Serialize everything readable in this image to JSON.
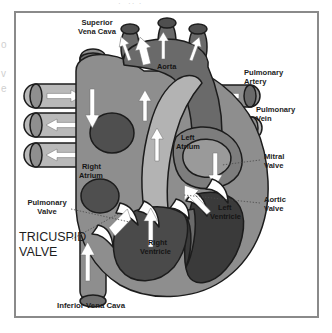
{
  "figure": {
    "type": "labeled-anatomical-illustration",
    "style": "grayscale line-and-tone scan"
  },
  "bleed": {
    "top_fragment": "·  ·· ·",
    "left_fragment": "o\n\nv\ne"
  },
  "colors": {
    "frame_border": "#8a8a8a",
    "background": "#ffffff",
    "outline": "#1c1c1c",
    "vessel_light": "#b9b9b9",
    "vessel_mid": "#9a9a9a",
    "muscle_mid": "#8e8e8e",
    "muscle_dark": "#6a6a6a",
    "chamber_dark": "#4f4f4f",
    "chamber_darkest": "#3a3a3a",
    "valve_white": "#ffffff",
    "arrow_white": "#ffffff",
    "label_text": "#1d1d1d",
    "leader_line": "#4a4a4a"
  },
  "labels": {
    "superior_vena_cava": "Superior\nVena Cava",
    "superior_vena_cava_line1": "Superior",
    "superior_vena_cava_line2": "Vena Cava",
    "aorta": "Aorta",
    "pulmonary_artery_line1": "Pulmonary",
    "pulmonary_artery_line2": "Artery",
    "pulmonary_vein_line1": "Pulmonary",
    "pulmonary_vein_line2": "Vein",
    "mitral_valve_line1": "Mitral",
    "mitral_valve_line2": "Valve",
    "aortic_valve_line1": "Aortic",
    "aortic_valve_line2": "Valve",
    "pulmonary_valve_line1": "Pulmonary",
    "pulmonary_valve_line2": "Valve",
    "tricuspid_valve_line1": "TRICUSPID",
    "tricuspid_valve_line2": "VALVE",
    "right_atrium_line1": "Right",
    "right_atrium_line2": "Atrium",
    "left_atrium_line1": "Left",
    "left_atrium_line2": "Atrium",
    "right_ventricle_line1": "Right",
    "right_ventricle_line2": "Ventricle",
    "left_ventricle_line1": "Left",
    "left_ventricle_line2": "Ventricle",
    "inferior_vena_cava": "Inferior Vena Cava"
  },
  "structures": [
    {
      "name": "superior-vena-cava",
      "kind": "vessel",
      "flow": "down"
    },
    {
      "name": "inferior-vena-cava",
      "kind": "vessel",
      "flow": "up"
    },
    {
      "name": "aorta",
      "kind": "great-artery",
      "flow": "up"
    },
    {
      "name": "aortic-arch-branches",
      "kind": "vessel",
      "count": 3,
      "flow": "up"
    },
    {
      "name": "pulmonary-artery",
      "kind": "vessel",
      "flow": "right"
    },
    {
      "name": "pulmonary-veins-left",
      "kind": "vessel",
      "count": 3,
      "flow": "left-right"
    },
    {
      "name": "pulmonary-veins-right",
      "kind": "vessel",
      "count": 2,
      "flow": "left"
    },
    {
      "name": "right-atrium",
      "kind": "chamber"
    },
    {
      "name": "left-atrium",
      "kind": "chamber"
    },
    {
      "name": "right-ventricle",
      "kind": "chamber"
    },
    {
      "name": "left-ventricle",
      "kind": "chamber"
    },
    {
      "name": "tricuspid-valve",
      "kind": "valve"
    },
    {
      "name": "mitral-valve",
      "kind": "valve"
    },
    {
      "name": "pulmonary-valve",
      "kind": "valve"
    },
    {
      "name": "aortic-valve",
      "kind": "valve"
    }
  ]
}
